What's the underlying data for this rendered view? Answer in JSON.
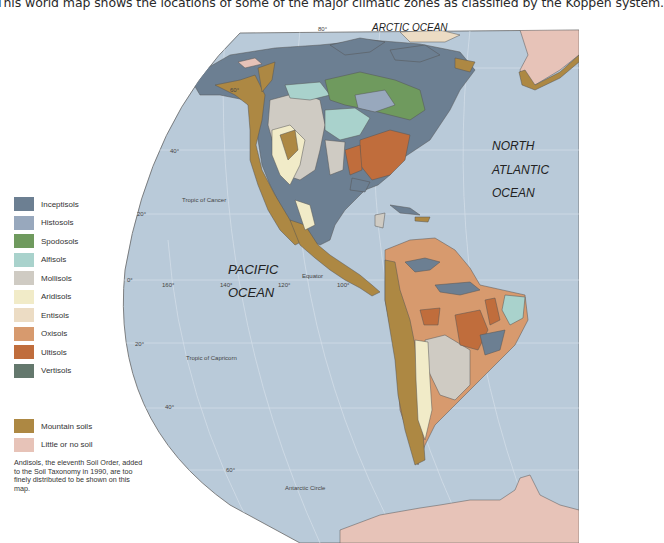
{
  "caption": "This world map shows the locations of some of the major climatic zones as classified by the Koppen system.",
  "map": {
    "ocean_color": "#b9cad9",
    "oceans": {
      "arctic": "ARCTIC OCEAN",
      "north_atlantic": [
        "NORTH",
        "ATLANTIC",
        "OCEAN"
      ],
      "pacific": [
        "PACIFIC",
        "OCEAN"
      ]
    },
    "lines": {
      "tropic_cancer": "Tropic of Cancer",
      "equator": "Equator",
      "tropic_capricorn": "Tropic of Capricorn",
      "antarctic_circle": "Antarctic Circle"
    },
    "lat_labels": [
      "80°",
      "60°",
      "40°",
      "20°",
      "0°",
      "20°",
      "40°",
      "60°"
    ],
    "lon_labels": [
      "160°",
      "140°",
      "120°",
      "100°"
    ]
  },
  "legend": {
    "orders": [
      {
        "label": "Inceptisols",
        "color": "#6c7f92"
      },
      {
        "label": "Histosols",
        "color": "#98a8bd"
      },
      {
        "label": "Spodosols",
        "color": "#6f9a5e"
      },
      {
        "label": "Alfisols",
        "color": "#a9d2cc"
      },
      {
        "label": "Mollisols",
        "color": "#cfcbc3"
      },
      {
        "label": "Aridisols",
        "color": "#f1ebc8"
      },
      {
        "label": "Entisols",
        "color": "#ecdcc4"
      },
      {
        "label": "Oxisols",
        "color": "#d79a6e"
      },
      {
        "label": "Ultisols",
        "color": "#c06d3c"
      },
      {
        "label": "Vertisols",
        "color": "#64786d"
      }
    ],
    "other": [
      {
        "label": "Mountain soils",
        "color": "#ad8843"
      },
      {
        "label": "Little or no soil",
        "color": "#e7c3b8"
      }
    ],
    "note": "Andisols, the eleventh Soil Order, added to the Soil Taxonomy in 1990, are too finely distributed to be shown on this map."
  }
}
